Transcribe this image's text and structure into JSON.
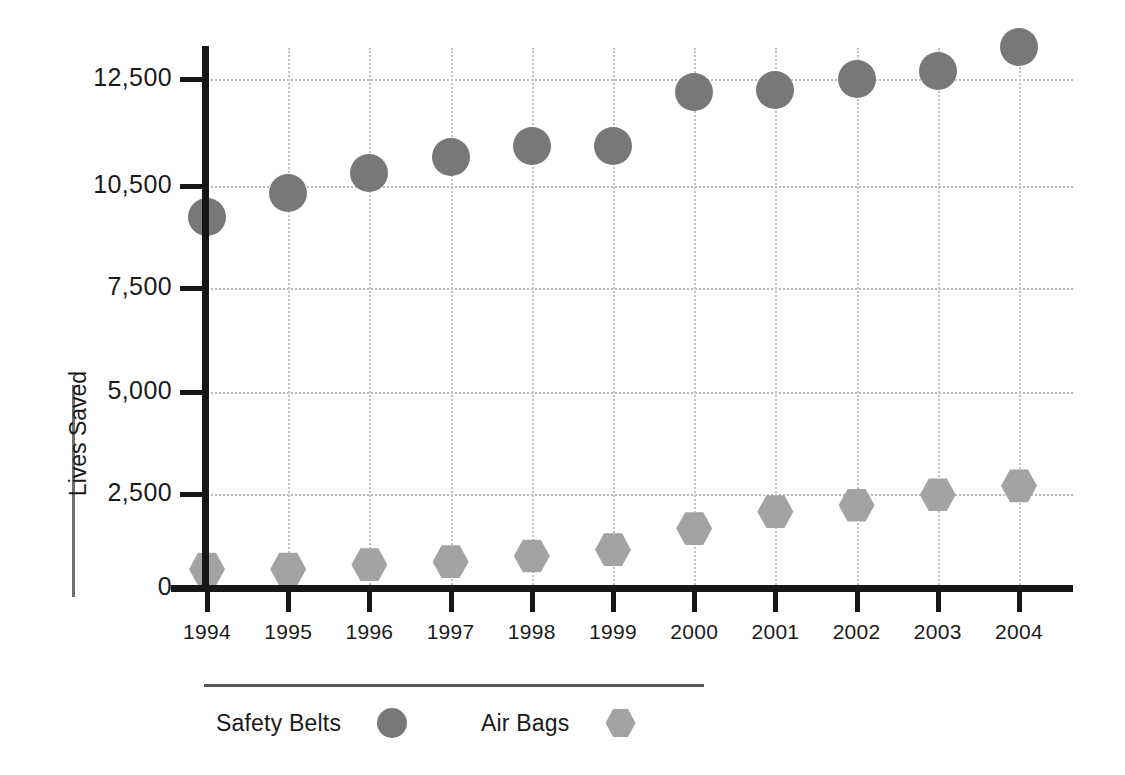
{
  "chart_data": {
    "type": "scatter",
    "title": "",
    "xlabel": "",
    "ylabel": "Lives Saved",
    "categories": [
      "1994",
      "1995",
      "1996",
      "1997",
      "1998",
      "1999",
      "2000",
      "2001",
      "2002",
      "2003",
      "2004"
    ],
    "x": [
      1994,
      1995,
      1996,
      1997,
      1998,
      1999,
      2000,
      2001,
      2002,
      2003,
      2004
    ],
    "ylim": [
      0,
      13500
    ],
    "yticks": [
      0,
      2500,
      5000,
      7500,
      10500,
      12500
    ],
    "ytick_labels": [
      "0",
      "2,500",
      "5,000",
      "7,500",
      "10,500",
      "12,500"
    ],
    "grid": true,
    "legend_position": "bottom",
    "series": [
      {
        "name": "Safety Belts",
        "marker": "circle",
        "color": "#787878",
        "values": [
          9600,
          10300,
          10750,
          11050,
          11250,
          11250,
          12250,
          12300,
          12500,
          12650,
          13100
        ]
      },
      {
        "name": "Air Bags",
        "marker": "hexagon",
        "color": "#a3a3a3",
        "values": [
          500,
          500,
          620,
          700,
          850,
          1020,
          1580,
          2030,
          2200,
          2480,
          2700
        ]
      }
    ]
  },
  "axes": {
    "y_title": "Lives Saved",
    "y_tick_labels": [
      "12,500",
      "10,500",
      "7,500",
      "5,000",
      "2,500",
      "0"
    ],
    "x_tick_labels": [
      "1994",
      "1995",
      "1996",
      "1997",
      "1998",
      "1999",
      "2000",
      "2001",
      "2002",
      "2003",
      "2004"
    ]
  },
  "legend": {
    "items": [
      {
        "label": "Safety Belts",
        "marker": "circle",
        "color": "#787878"
      },
      {
        "label": "Air Bags",
        "marker": "hexagon",
        "color": "#a3a3a3"
      }
    ]
  },
  "colors": {
    "safety_belts": "#787878",
    "air_bags": "#a3a3a3",
    "axis": "#161616",
    "grid": "#b9b9b9",
    "text": "#1a1a1a",
    "background": "#ffffff"
  }
}
